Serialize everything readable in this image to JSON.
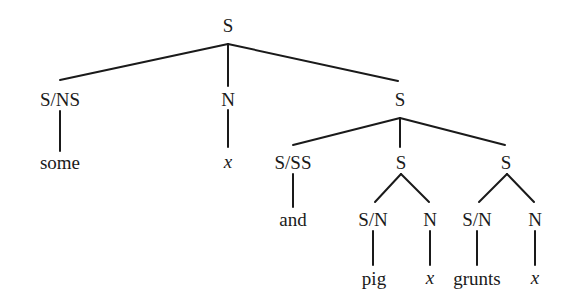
{
  "diagram": {
    "type": "syntax-tree",
    "stroke_color": "#1a1a1a",
    "nodes": [
      {
        "id": "n0",
        "label": "S",
        "x": 228,
        "y": 25,
        "italic": false
      },
      {
        "id": "n1",
        "label": "S/NS",
        "x": 60,
        "y": 99,
        "italic": false
      },
      {
        "id": "n2",
        "label": "N",
        "x": 228,
        "y": 99,
        "italic": false
      },
      {
        "id": "n3",
        "label": "S",
        "x": 400,
        "y": 99,
        "italic": false
      },
      {
        "id": "n4",
        "label": "some",
        "x": 60,
        "y": 162,
        "italic": false
      },
      {
        "id": "n5",
        "label": "x",
        "x": 228,
        "y": 161,
        "italic": true
      },
      {
        "id": "n6",
        "label": "S/SS",
        "x": 293,
        "y": 162,
        "italic": false
      },
      {
        "id": "n7",
        "label": "S",
        "x": 401,
        "y": 162,
        "italic": false
      },
      {
        "id": "n8",
        "label": "S",
        "x": 506,
        "y": 162,
        "italic": false
      },
      {
        "id": "n9",
        "label": "and",
        "x": 293,
        "y": 219,
        "italic": false
      },
      {
        "id": "n10",
        "label": "S/N",
        "x": 373,
        "y": 219,
        "italic": false
      },
      {
        "id": "n11",
        "label": "N",
        "x": 430,
        "y": 219,
        "italic": false
      },
      {
        "id": "n12",
        "label": "S/N",
        "x": 477,
        "y": 219,
        "italic": false
      },
      {
        "id": "n13",
        "label": "N",
        "x": 535,
        "y": 219,
        "italic": false
      },
      {
        "id": "n14",
        "label": "pig",
        "x": 374,
        "y": 278,
        "italic": false
      },
      {
        "id": "n15",
        "label": "x",
        "x": 430,
        "y": 277,
        "italic": true
      },
      {
        "id": "n16",
        "label": "grunts",
        "x": 477,
        "y": 278,
        "italic": false
      },
      {
        "id": "n17",
        "label": "x",
        "x": 535,
        "y": 277,
        "italic": true
      }
    ],
    "edges": [
      {
        "from": "n0",
        "to": "n1",
        "x1": 228,
        "y1": 44,
        "x2": 60,
        "y2": 80
      },
      {
        "from": "n0",
        "to": "n2",
        "x1": 228,
        "y1": 44,
        "x2": 228,
        "y2": 86
      },
      {
        "from": "n0",
        "to": "n3",
        "x1": 228,
        "y1": 44,
        "x2": 398,
        "y2": 81
      },
      {
        "from": "n1",
        "to": "n4",
        "x1": 60,
        "y1": 111,
        "x2": 60,
        "y2": 151
      },
      {
        "from": "n2",
        "to": "n5",
        "x1": 228,
        "y1": 110,
        "x2": 228,
        "y2": 147
      },
      {
        "from": "n3",
        "to": "n6",
        "x1": 400,
        "y1": 118,
        "x2": 293,
        "y2": 145
      },
      {
        "from": "n3",
        "to": "n7",
        "x1": 400,
        "y1": 118,
        "x2": 400,
        "y2": 147
      },
      {
        "from": "n3",
        "to": "n8",
        "x1": 400,
        "y1": 118,
        "x2": 505,
        "y2": 145
      },
      {
        "from": "n6",
        "to": "n9",
        "x1": 293,
        "y1": 174,
        "x2": 293,
        "y2": 207
      },
      {
        "from": "n7",
        "to": "n10",
        "x1": 401,
        "y1": 174,
        "x2": 375,
        "y2": 202
      },
      {
        "from": "n7",
        "to": "n11",
        "x1": 401,
        "y1": 174,
        "x2": 429,
        "y2": 202
      },
      {
        "from": "n8",
        "to": "n12",
        "x1": 507,
        "y1": 174,
        "x2": 479,
        "y2": 202
      },
      {
        "from": "n8",
        "to": "n13",
        "x1": 507,
        "y1": 174,
        "x2": 534,
        "y2": 202
      },
      {
        "from": "n10",
        "to": "n14",
        "x1": 373,
        "y1": 231,
        "x2": 373,
        "y2": 265
      },
      {
        "from": "n11",
        "to": "n15",
        "x1": 430,
        "y1": 231,
        "x2": 430,
        "y2": 265
      },
      {
        "from": "n12",
        "to": "n16",
        "x1": 477,
        "y1": 231,
        "x2": 477,
        "y2": 265
      },
      {
        "from": "n13",
        "to": "n17",
        "x1": 535,
        "y1": 231,
        "x2": 535,
        "y2": 265
      }
    ]
  }
}
